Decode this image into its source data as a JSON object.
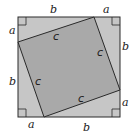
{
  "diagram": {
    "colors": {
      "background": "#ffffff",
      "outer_fill": "#c6c6c6",
      "inner_fill": "#a9a9a9",
      "stroke": "#2a2a2a",
      "label": "#1a1a1a"
    },
    "outer_square": {
      "x": 18,
      "y": 17,
      "size": 102
    },
    "inner_square": {
      "points": "94,17 120,90 44,117 18,42"
    },
    "right_angle_markers": [
      {
        "corner": "top-left",
        "x": 18,
        "y": 17,
        "dx": 1,
        "dy": 1
      },
      {
        "corner": "top-right",
        "x": 120,
        "y": 17,
        "dx": -1,
        "dy": 1
      },
      {
        "corner": "bottom-left",
        "x": 18,
        "y": 117,
        "dx": 1,
        "dy": -1
      },
      {
        "corner": "bottom-right",
        "x": 120,
        "y": 117,
        "dx": -1,
        "dy": -1
      }
    ],
    "labels": {
      "top_b": "b",
      "top_a": "a",
      "left_a": "a",
      "left_b": "b",
      "right_b": "b",
      "right_a": "a",
      "bottom_a": "a",
      "bottom_b": "b",
      "c_top": "c",
      "c_right": "c",
      "c_left": "c",
      "c_bottom": "c"
    }
  }
}
